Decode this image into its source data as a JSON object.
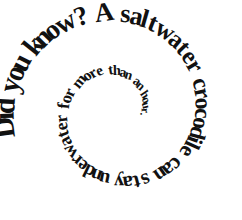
{
  "graphic": {
    "kind": "spiral-text",
    "full_text": "Did you know? A saltwater crocodile can stay underwater for more than an hour.",
    "background_color": "#ffffff",
    "text_color": "#111111",
    "direction": "clockwise-inward",
    "start_position": "lower-left",
    "segments": [
      {
        "id": "seg-1",
        "text": "Did you know?",
        "ring": "outer"
      },
      {
        "id": "seg-2",
        "text": "A saltwater crocodile can stay",
        "ring": "outer"
      },
      {
        "id": "seg-3",
        "text": "underwater for more than an",
        "ring": "middle"
      },
      {
        "id": "seg-4",
        "text": "hour.",
        "ring": "inner"
      }
    ],
    "words": [
      "Did",
      "you",
      "know?",
      "A",
      "saltwater",
      "crocodile",
      "can",
      "stay",
      "underwater",
      "for",
      "more",
      "than",
      "an",
      "hour."
    ]
  },
  "spiral_layout": {
    "center_x": 118,
    "center_y": 112,
    "start_angle_deg": 168,
    "total_sweep_deg": 560,
    "start_radius": 103,
    "end_radius": 21,
    "start_font_size": 30,
    "end_font_size": 11,
    "letter_spacing_factor": 0.62
  }
}
